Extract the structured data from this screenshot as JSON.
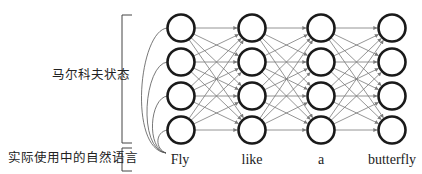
{
  "diagram": {
    "title": "",
    "labels": {
      "markov_states": "马尔科夫状态",
      "natural_language": "实际使用中的自然语言"
    },
    "words": [
      "Fly",
      "like",
      "a",
      "butterfly"
    ],
    "layout": {
      "columns_x": [
        181,
        252,
        321,
        392
      ],
      "rows_y": [
        28,
        62,
        96,
        130
      ],
      "node_radius": 13.5,
      "words_y": 160,
      "word_origin": {
        "x": 166,
        "y": 153
      }
    },
    "colors": {
      "node_stroke": "#1a1a1a",
      "edge": "#7a7a7a",
      "bracket": "#444444",
      "text": "#222222"
    },
    "structure": {
      "nodes_per_column": 4,
      "columns": 4,
      "connection": "fully-connected between adjacent columns",
      "first_word_links_to_all_first_column_nodes": true
    }
  }
}
